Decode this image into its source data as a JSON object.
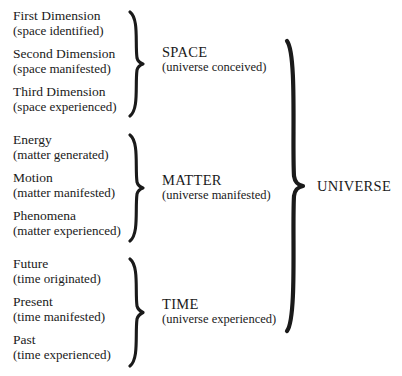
{
  "diagram": {
    "ink_color": "#1a1a1a",
    "background_color": "#ffffff",
    "root": {
      "label": "UNIVERSE",
      "brace_icon": "curly-brace-right"
    },
    "groups": [
      {
        "id": "space",
        "category": "SPACE",
        "category_sub": "(universe conceived)",
        "brace_icon": "curly-brace-right",
        "items": [
          {
            "title": "First Dimension",
            "sub": "(space identified)"
          },
          {
            "title": "Second Dimension",
            "sub": "(space manifested)"
          },
          {
            "title": "Third Dimension",
            "sub": "(space experienced)"
          }
        ]
      },
      {
        "id": "matter",
        "category": "MATTER",
        "category_sub": "(universe manifested)",
        "brace_icon": "curly-brace-right",
        "items": [
          {
            "title": "Energy",
            "sub": "(matter generated)"
          },
          {
            "title": "Motion",
            "sub": "(matter manifested)"
          },
          {
            "title": "Phenomena",
            "sub": "(matter experienced)"
          }
        ]
      },
      {
        "id": "time",
        "category": "TIME",
        "category_sub": "(universe experienced)",
        "brace_icon": "curly-brace-right",
        "items": [
          {
            "title": "Future",
            "sub": "(time originated)"
          },
          {
            "title": "Present",
            "sub": "(time manifested)"
          },
          {
            "title": "Past",
            "sub": "(time experienced)"
          }
        ]
      }
    ]
  }
}
